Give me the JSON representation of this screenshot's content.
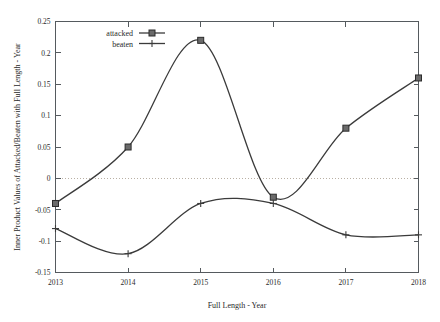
{
  "chart_data": {
    "type": "line",
    "title": "",
    "xlabel": "Full Length - Year",
    "ylabel": "Inner Product Values of Attacked/Beaten with Full Length - Year",
    "x": [
      2013,
      2014,
      2015,
      2016,
      2017,
      2018
    ],
    "xlim": [
      2013,
      2018
    ],
    "ylim": [
      -0.15,
      0.25
    ],
    "xticklabels": [
      "2013",
      "2014",
      "2015",
      "2016",
      "2017",
      "2018"
    ],
    "yticklabels": [
      "0.25",
      "0.2",
      "0.15",
      "0.1",
      "0.05",
      "0",
      "-0.05",
      "-0.1",
      "-0.15"
    ],
    "ytickvalues": [
      0.25,
      0.2,
      0.15,
      0.1,
      0.05,
      0,
      -0.05,
      -0.1,
      -0.15
    ],
    "grid": false,
    "zero_reference_line": true,
    "interpolation": "smooth-spline",
    "legend_position": "top-left-inside",
    "series": [
      {
        "name": "attacked",
        "marker": "square",
        "values": [
          -0.04,
          0.05,
          0.22,
          -0.03,
          0.08,
          0.16
        ]
      },
      {
        "name": "beaten",
        "marker": "plus",
        "values": [
          -0.08,
          -0.12,
          -0.04,
          -0.04,
          -0.09,
          -0.09
        ]
      }
    ],
    "colors": {
      "line": "#3b3b3b",
      "marker_fill": "#6b6b6b",
      "axis": "#555a5e",
      "zero_line": "#b9b0a4",
      "background": "#ffffff"
    }
  },
  "legend": {
    "items": [
      {
        "label": "attacked",
        "marker": "square"
      },
      {
        "label": "beaten",
        "marker": "plus"
      }
    ]
  }
}
